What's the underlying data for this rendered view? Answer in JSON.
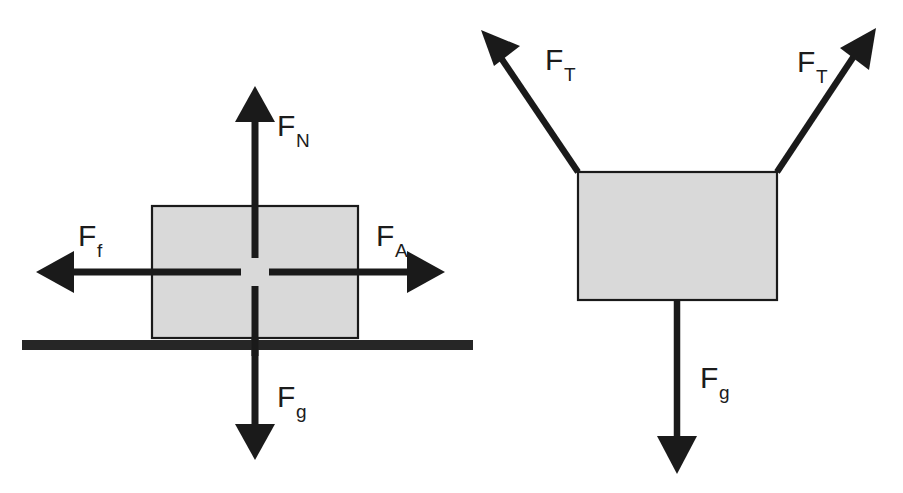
{
  "figure": {
    "background_color": "#ffffff",
    "ink_color": "#1a1a1a",
    "body_fill_color": "#d9d9d9",
    "ground_color": "#262626"
  },
  "diagrams": [
    {
      "id": "block-on-surface",
      "name": "Block on a horizontal surface",
      "body": {
        "name": "block",
        "shape": "rectangle",
        "x": 152,
        "y": 206,
        "width": 206,
        "height": 132,
        "fill": "#d9d9d9"
      },
      "ground": {
        "name": "surface",
        "x": 22,
        "y": 340,
        "width": 451,
        "height": 10
      },
      "origin": {
        "x": 255,
        "y": 272
      },
      "forces": [
        {
          "key": "normal",
          "label_base": "F",
          "label_sub": "N",
          "direction": "up",
          "angle_deg": 90,
          "tail": {
            "x": 255,
            "y": 258
          },
          "tip": {
            "x": 255,
            "y": 88
          },
          "label_pos": {
            "x": 277,
            "y": 136
          }
        },
        {
          "key": "friction",
          "label_base": "F",
          "label_sub": "f",
          "direction": "left",
          "angle_deg": 180,
          "tail": {
            "x": 241,
            "y": 272
          },
          "tip": {
            "x": 38,
            "y": 272
          },
          "label_pos": {
            "x": 78,
            "y": 246
          }
        },
        {
          "key": "applied",
          "label_base": "F",
          "label_sub": "A",
          "direction": "right",
          "angle_deg": 0,
          "tail": {
            "x": 269,
            "y": 272
          },
          "tip": {
            "x": 443,
            "y": 272
          },
          "label_pos": {
            "x": 376,
            "y": 246
          }
        },
        {
          "key": "gravity",
          "label_base": "F",
          "label_sub": "g",
          "direction": "down",
          "angle_deg": 270,
          "tail": {
            "x": 255,
            "y": 286
          },
          "tip": {
            "x": 255,
            "y": 458
          },
          "label_pos": {
            "x": 277,
            "y": 407
          }
        }
      ]
    },
    {
      "id": "hanging-block",
      "name": "Block suspended by two ropes",
      "body": {
        "name": "block",
        "shape": "rectangle",
        "x": 578,
        "y": 172,
        "width": 199,
        "height": 128,
        "fill": "#d9d9d9"
      },
      "ground": null,
      "origin": {
        "x": 677,
        "y": 236
      },
      "forces": [
        {
          "key": "tension-left",
          "label_base": "F",
          "label_sub": "T",
          "direction": "up-left",
          "angle_deg": 127,
          "tail": {
            "x": 578,
            "y": 172
          },
          "tip": {
            "x": 483,
            "y": 32
          },
          "label_pos": {
            "x": 545,
            "y": 70
          }
        },
        {
          "key": "tension-right",
          "label_base": "F",
          "label_sub": "T",
          "direction": "up-right",
          "angle_deg": 54,
          "tail": {
            "x": 777,
            "y": 172
          },
          "tip": {
            "x": 875,
            "y": 30
          },
          "label_pos": {
            "x": 797,
            "y": 72
          }
        },
        {
          "key": "gravity",
          "label_base": "F",
          "label_sub": "g",
          "direction": "down",
          "angle_deg": 270,
          "tail": {
            "x": 677,
            "y": 300
          },
          "tip": {
            "x": 677,
            "y": 472
          },
          "label_pos": {
            "x": 700,
            "y": 388
          }
        }
      ]
    }
  ]
}
